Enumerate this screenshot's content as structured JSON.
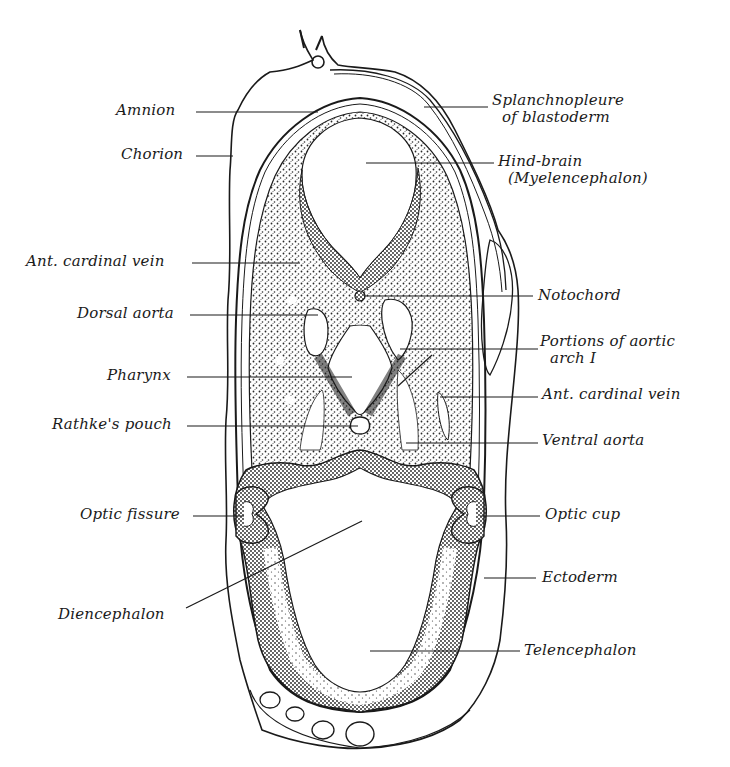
{
  "figure": {
    "colors": {
      "ink": "#1a1a1a",
      "paper": "#ffffff",
      "stipple": "#2a2a2a"
    }
  },
  "labels": {
    "left": [
      {
        "id": "amnion",
        "text": "Amnion"
      },
      {
        "id": "chorion",
        "text": "Chorion"
      },
      {
        "id": "ant_cardinal_vein_left",
        "text": "Ant. cardinal vein"
      },
      {
        "id": "dorsal_aorta",
        "text": "Dorsal aorta"
      },
      {
        "id": "pharynx",
        "text": "Pharynx"
      },
      {
        "id": "rathkes_pouch",
        "text": "Rathke's pouch"
      },
      {
        "id": "optic_fissure",
        "text": "Optic fissure"
      },
      {
        "id": "diencephalon",
        "text": "Diencephalon"
      }
    ],
    "right": [
      {
        "id": "splanchnopleure",
        "text": "Splanchnopleure",
        "text2": "of blastoderm"
      },
      {
        "id": "hind_brain",
        "text": "Hind-brain",
        "text2": "(Myelencephalon)"
      },
      {
        "id": "notochord",
        "text": "Notochord"
      },
      {
        "id": "aortic_arch",
        "text": "Portions of aortic",
        "text2": "arch I"
      },
      {
        "id": "ant_cardinal_vein_right",
        "text": "Ant. cardinal vein"
      },
      {
        "id": "ventral_aorta",
        "text": "Ventral aorta"
      },
      {
        "id": "optic_cup",
        "text": "Optic cup"
      },
      {
        "id": "ectoderm",
        "text": "Ectoderm"
      },
      {
        "id": "telencephalon",
        "text": "Telencephalon"
      }
    ]
  }
}
